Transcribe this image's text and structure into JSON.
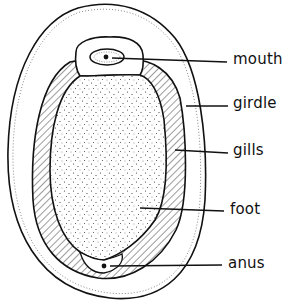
{
  "diagram": {
    "labels": [
      {
        "id": "mouth",
        "text": "mouth"
      },
      {
        "id": "girdle",
        "text": "girdle"
      },
      {
        "id": "gills",
        "text": "gills"
      },
      {
        "id": "foot",
        "text": "foot"
      },
      {
        "id": "anus",
        "text": "anus"
      }
    ],
    "colors": {
      "ink": "#111111",
      "background": "#ffffff"
    }
  }
}
